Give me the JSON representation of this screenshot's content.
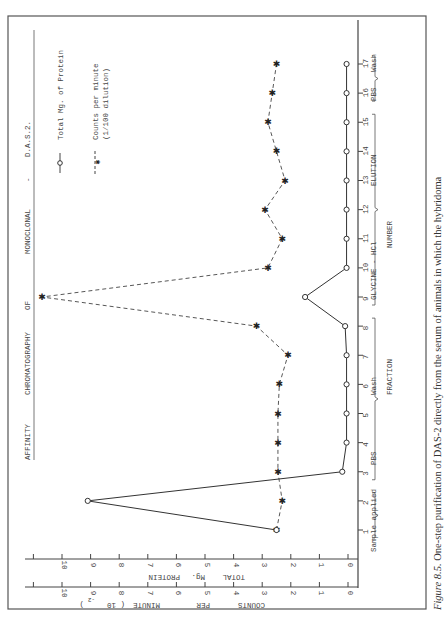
{
  "chart_data": {
    "type": "line",
    "orientation": "rotated 90deg counterclockwise (fraction axis vertical on right, value axes along bottom)",
    "xlabel": "FRACTION NUMBER",
    "ylabel_left": "TOTAL Mg. PROTEIN",
    "ylabel_right": "COUNTS PER MINUTE ( 10^-2)",
    "ylim": [
      0,
      11
    ],
    "y_ticks": [
      0,
      1,
      2,
      3,
      4,
      5,
      6,
      7,
      8,
      9,
      10
    ],
    "x": [
      1,
      2,
      3,
      4,
      5,
      6,
      7,
      8,
      9,
      10,
      11,
      12,
      13,
      14,
      15,
      16,
      17
    ],
    "series": [
      {
        "name": "Total Mg. of Protein",
        "style": "solid line, open circle markers",
        "values": [
          2.5,
          9.1,
          0.2,
          0.05,
          0.05,
          0.05,
          0.05,
          0.1,
          1.5,
          0.05,
          0.05,
          0.05,
          0.05,
          0.05,
          0.05,
          0.05,
          0.05
        ]
      },
      {
        "name": "Counts per minute (1/100 dilution)",
        "style": "dashed line, star/x markers",
        "values": [
          2.5,
          2.3,
          2.45,
          2.45,
          2.45,
          2.4,
          2.1,
          3.2,
          10.7,
          2.8,
          2.3,
          2.9,
          2.2,
          2.5,
          2.8,
          2.65,
          2.5
        ]
      }
    ],
    "annotations": [
      {
        "label": "Sample applied",
        "fractions": [
          1,
          2
        ]
      },
      {
        "label": "PBS Wash",
        "fractions": [
          3,
          8
        ]
      },
      {
        "label": "GLYCINE - HCl ELUTION",
        "fractions": [
          9,
          15
        ]
      },
      {
        "label": "PBS Wash",
        "fractions": [
          16,
          17
        ]
      }
    ],
    "grid": false,
    "legend_position": "top-left (rotated)"
  },
  "legend": {
    "protein": "Total Mg. of Protein",
    "cpm_line1": "Counts per minute",
    "cpm_line2": "(1/100 dilution)"
  },
  "title": {
    "w1": "AFFINITY",
    "w2": "CHROMATOGRAPHY",
    "w3": "OF",
    "w4": "MONOCLONAL",
    "w5": "-",
    "w6": "D.A.S.2."
  },
  "axes": {
    "protein_label_1": "TOTAL",
    "protein_label_2": "Mg.",
    "protein_label_3": "PROTEIN",
    "cpm_label_1": "COUNTS",
    "cpm_label_2": "PER",
    "cpm_label_3": "MINUTE",
    "cpm_label_4": "(  10",
    "cpm_label_5": "-2",
    "cpm_label_6": ")",
    "fraction_label_1": "FRACTION",
    "fraction_label_2": "NUMBER"
  },
  "phases": {
    "sample": "Sample applied",
    "pbs1_a": "PBS",
    "pbs1_b": "Wash",
    "elution_a": "GLYCINE - HCl",
    "elution_b": "ELUTION",
    "pbs2_a": "PBS",
    "pbs2_b": "Wash"
  },
  "caption": {
    "figure_label": "Figure 8.5.",
    "text": " One-step purification of DAS-2 directly from the serum of animals in which the hybridoma"
  }
}
